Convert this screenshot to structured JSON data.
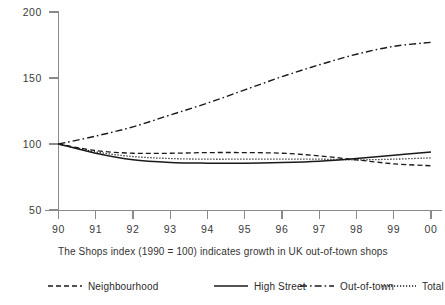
{
  "chart_data": {
    "type": "line",
    "title": "",
    "subtitle": "",
    "caption": "The Shops index (1990 = 100) indicates growth in UK out-of-town shops",
    "xlabel": "",
    "ylabel": "",
    "xlim": [
      90,
      100
    ],
    "ylim": [
      50,
      200
    ],
    "grid": false,
    "legend_position": "bottom",
    "x": [
      90,
      91,
      92,
      93,
      94,
      95,
      96,
      97,
      98,
      99,
      100
    ],
    "xtick_labels": [
      "90",
      "91",
      "92",
      "93",
      "94",
      "95",
      "96",
      "97",
      "98",
      "99",
      "00"
    ],
    "ytick_labels": [
      "200",
      "150",
      "100",
      "50"
    ],
    "yticks": [
      200,
      150,
      100,
      50
    ],
    "series": [
      {
        "name": "Neighbourhood",
        "style": "dashed",
        "values": [
          100,
          95,
          93,
          93,
          93.5,
          93.5,
          93,
          91,
          88,
          85,
          83.5
        ]
      },
      {
        "name": "High Street",
        "style": "solid",
        "values": [
          100,
          93,
          88,
          86,
          85.5,
          85.5,
          86,
          87,
          89,
          91.5,
          94
        ]
      },
      {
        "name": "Out-of-town",
        "style": "dash-dot",
        "values": [
          100,
          106,
          113,
          122,
          131,
          141,
          151,
          160,
          168,
          174,
          177
        ]
      },
      {
        "name": "Total",
        "style": "dotted",
        "values": [
          100,
          94,
          90.5,
          89,
          88.5,
          88.5,
          88.5,
          88.5,
          88,
          88.5,
          89.5
        ]
      }
    ]
  },
  "legend": {
    "items": [
      {
        "label": "Neighbourhood",
        "style": "dashed"
      },
      {
        "label": "High Street",
        "style": "solid"
      },
      {
        "label": "Out-of-town",
        "style": "dash-dot"
      },
      {
        "label": "Total",
        "style": "dotted"
      }
    ]
  },
  "colors": {
    "line": "#1a1a1a",
    "axis": "#8a8a8a",
    "text": "#2a2a2a",
    "background": "#ffffff"
  }
}
